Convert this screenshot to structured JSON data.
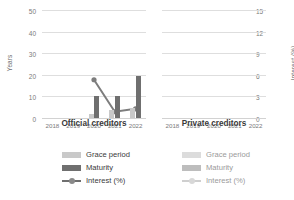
{
  "chart_data": {
    "type": "bar",
    "title": "",
    "subtitle": "",
    "categories": [
      "2018",
      "2019",
      "2020",
      "2021",
      "2022"
    ],
    "ylabel": "Years",
    "y2label": "Interest (%)",
    "xlabel": "",
    "ylim": [
      0,
      50
    ],
    "y2lim": [
      0,
      15
    ],
    "yticks": [
      "0",
      "10",
      "20",
      "30",
      "40",
      "50"
    ],
    "y2ticks": [
      "0",
      "3",
      "6",
      "9",
      "12",
      "15"
    ],
    "grid": true,
    "legend_position": "bottom",
    "panels": [
      {
        "name": "Official creditors",
        "has_data": true,
        "series": [
          {
            "name": "Grace period",
            "type": "bar",
            "axis": "left",
            "color": "#c9c9c9",
            "values": [
              null,
              null,
              2.0,
              3.5,
              4.5
            ]
          },
          {
            "name": "Maturity",
            "type": "bar",
            "axis": "left",
            "color": "#6f6f6f",
            "values": [
              null,
              null,
              10.0,
              10.0,
              19.5
            ]
          },
          {
            "name": "Interest (%)",
            "type": "line",
            "axis": "right",
            "color": "#7d7d7d",
            "values": [
              null,
              null,
              5.4,
              1.0,
              1.4
            ]
          }
        ]
      },
      {
        "name": "Private creditors",
        "has_data": false,
        "series": [
          {
            "name": "Grace period",
            "type": "bar",
            "axis": "left",
            "color": "#dcdcdc",
            "values": [
              null,
              null,
              null,
              null,
              null
            ]
          },
          {
            "name": "Maturity",
            "type": "bar",
            "axis": "left",
            "color": "#bdbdbd",
            "values": [
              null,
              null,
              null,
              null,
              null
            ]
          },
          {
            "name": "Interest (%)",
            "type": "line",
            "axis": "right",
            "color": "#cfcfcf",
            "values": [
              null,
              null,
              null,
              null,
              null
            ]
          }
        ]
      }
    ]
  },
  "legend_left": {
    "grace_label": "Grace period",
    "maturity_label": "Maturity",
    "interest_label": "Interest (%)"
  },
  "legend_right": {
    "grace_label": "Grace period",
    "maturity_label": "Maturity",
    "interest_label": "Interest (%)"
  },
  "colors": {
    "grace": "#c9c9c9",
    "maturity": "#6f6f6f",
    "interest": "#7d7d7d",
    "grace_muted": "#dcdcdc",
    "maturity_muted": "#bdbdbd",
    "interest_muted": "#cfcfcf",
    "grid": "#dedede",
    "text": "#3a3a3a",
    "tick_text": "#7a7a7a"
  }
}
